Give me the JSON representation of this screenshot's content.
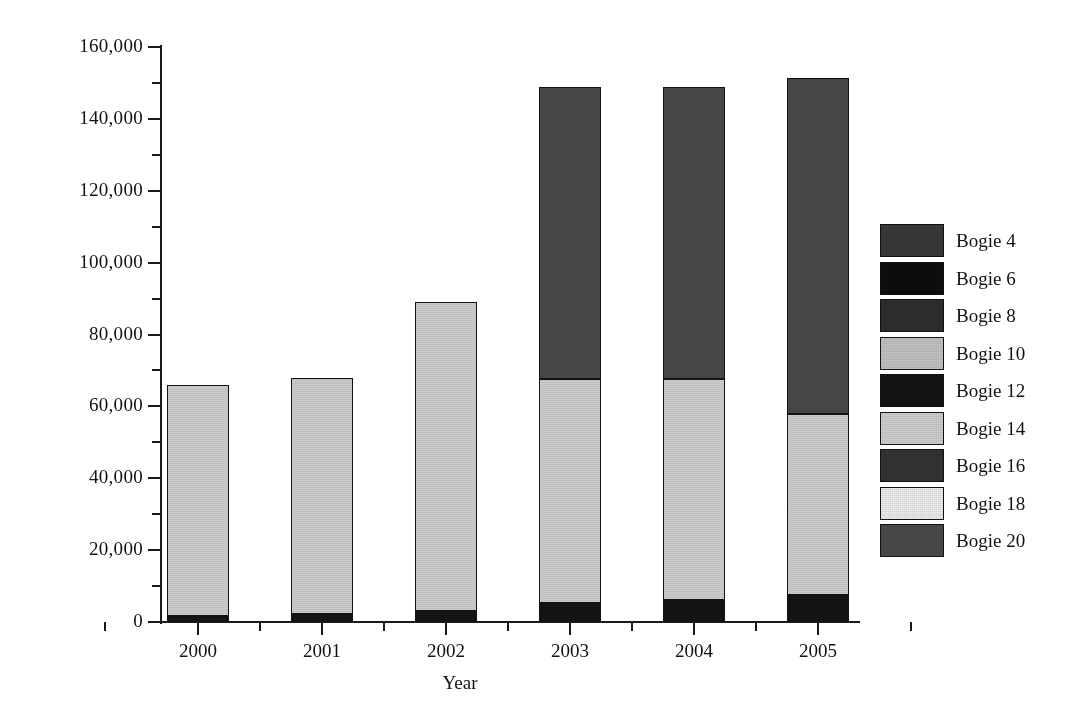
{
  "chart_data": {
    "type": "bar",
    "subtype": "stacked-bar",
    "title": "",
    "xlabel": "Year",
    "ylabel": "",
    "categories": [
      "2000",
      "2001",
      "2002",
      "2003",
      "2004",
      "2005"
    ],
    "ylim": [
      0,
      160000
    ],
    "ytick_values": [
      0,
      20000,
      40000,
      60000,
      80000,
      100000,
      120000,
      140000,
      160000
    ],
    "ytick_labels": [
      "0",
      "20,000",
      "40,000",
      "60,000",
      "80,000",
      "100,000",
      "120,000",
      "140,000",
      "160,000"
    ],
    "ytick_minor_values": [
      10000,
      30000,
      50000,
      70000,
      90000,
      110000,
      130000,
      150000
    ],
    "grid": false,
    "legend_position": "right",
    "series": [
      {
        "name": "Bogie 4",
        "color": "#3a3a3a",
        "values": [
          0,
          0,
          0,
          0,
          0,
          0
        ]
      },
      {
        "name": "Bogie 6",
        "color": "#0d0d0d",
        "values": [
          0,
          0,
          0,
          0,
          0,
          0
        ]
      },
      {
        "name": "Bogie 8",
        "color": "#2e2e2e",
        "values": [
          0,
          0,
          0,
          0,
          0,
          0
        ]
      },
      {
        "name": "Bogie 10",
        "color": "#c2c2c2",
        "values": [
          0,
          0,
          0,
          0,
          0,
          0
        ]
      },
      {
        "name": "Bogie 12",
        "color": "#141414",
        "values": [
          1700,
          2100,
          3000,
          5200,
          6000,
          7500
        ]
      },
      {
        "name": "Bogie 14",
        "color": "#cfcfcf",
        "values": [
          64300,
          65900,
          86000,
          62300,
          61500,
          50300
        ]
      },
      {
        "name": "Bogie 16",
        "color": "#333333",
        "values": [
          0,
          0,
          0,
          0,
          0,
          0
        ]
      },
      {
        "name": "Bogie 18",
        "color": "#ededed",
        "values": [
          0,
          0,
          0,
          0,
          0,
          0
        ]
      },
      {
        "name": "Bogie 20",
        "color": "#4a4a4a",
        "values": [
          0,
          0,
          0,
          81500,
          81500,
          93700
        ]
      }
    ],
    "totals": [
      66000,
      68000,
      89000,
      149000,
      149000,
      151500
    ],
    "bar_pixel_layout": {
      "slot_lefts": [
        167,
        291,
        415,
        539,
        663,
        787
      ],
      "bar_width": 62,
      "baseline_y": 622,
      "px_per_unit": 0.0035938
    }
  },
  "legend": {
    "items": [
      {
        "label": "Bogie 4",
        "color": "#3a3a3a"
      },
      {
        "label": "Bogie 6",
        "color": "#0d0d0d"
      },
      {
        "label": "Bogie 8",
        "color": "#2e2e2e"
      },
      {
        "label": "Bogie 10",
        "color": "#c2c2c2"
      },
      {
        "label": "Bogie 12",
        "color": "#141414"
      },
      {
        "label": "Bogie 14",
        "color": "#cfcfcf"
      },
      {
        "label": "Bogie 16",
        "color": "#333333"
      },
      {
        "label": "Bogie 18",
        "color": "#ededed"
      },
      {
        "label": "Bogie 20",
        "color": "#4a4a4a"
      }
    ]
  },
  "axes": {
    "x_title": "Year"
  }
}
